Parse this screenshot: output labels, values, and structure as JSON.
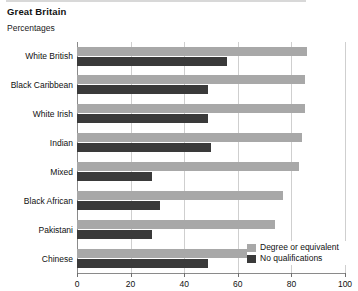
{
  "header": {
    "title": "Great Britain",
    "subtitle": "Percentages"
  },
  "legend": {
    "items": [
      {
        "label": "Degree or equivalent",
        "color": "#a8a8a8",
        "key": "degree"
      },
      {
        "label": "No qualifications",
        "color": "#3a3a3a",
        "key": "noqual"
      }
    ]
  },
  "axis": {
    "x_ticks": [
      "0",
      "20",
      "40",
      "60",
      "80",
      "100"
    ]
  },
  "chart_data": {
    "type": "bar",
    "orientation": "horizontal",
    "title": "Great Britain",
    "subtitle": "Percentages",
    "xlabel": "",
    "ylabel": "",
    "xlim": [
      0,
      100
    ],
    "xticks": [
      0,
      20,
      40,
      60,
      80,
      100
    ],
    "grid": true,
    "legend_position": "bottom-right",
    "categories": [
      "White British",
      "Black Caribbean",
      "White Irish",
      "Indian",
      "Mixed",
      "Black African",
      "Pakistani",
      "Chinese"
    ],
    "series": [
      {
        "name": "Degree or equivalent",
        "color": "#a8a8a8",
        "values": [
          86,
          85,
          85,
          84,
          83,
          77,
          74,
          67
        ]
      },
      {
        "name": "No qualifications",
        "color": "#3a3a3a",
        "values": [
          56,
          49,
          49,
          50,
          28,
          31,
          28,
          49
        ]
      }
    ]
  }
}
